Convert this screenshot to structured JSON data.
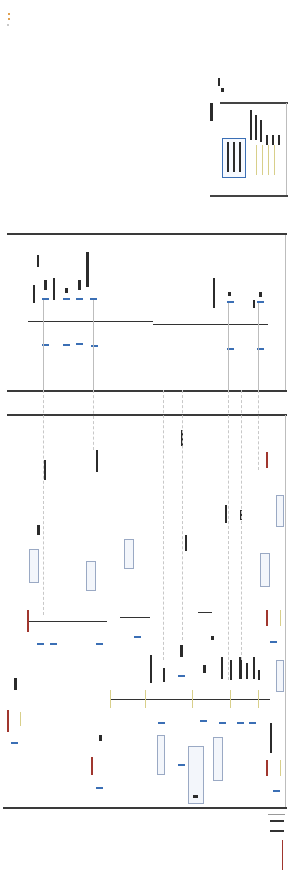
{
  "diagram": {
    "type": "single-line schematic (rotated, illegible at resolution)",
    "orientation": "rotated 90 degrees",
    "panels": [
      {
        "name": "top-inset",
        "top": 100,
        "bottom": 197,
        "left": 208,
        "right": 287
      },
      {
        "name": "upper-section",
        "top": 232,
        "bottom": 391
      },
      {
        "name": "lower-section",
        "top": 414,
        "bottom": 808
      }
    ],
    "colors": {
      "frame_line": "#3a3a3a",
      "bus_line": "#555555",
      "marker_blue": "#3b6fb5",
      "generator_red": "#a0362e",
      "connector_yellow": "#d8cf8a",
      "header_orange": "#e0a050"
    },
    "legend": {
      "lines": [
        "--------",
        "-------"
      ],
      "note": "legend text illegible"
    }
  }
}
